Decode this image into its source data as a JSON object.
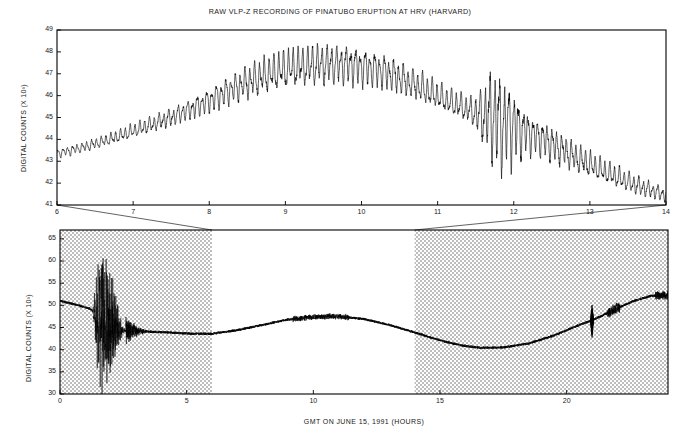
{
  "figure": {
    "title": "RAW VLP-Z RECORDING OF PINATUBO ERUPTION AT HRV (HARVARD)",
    "background_color": "#ffffff",
    "trace_color": "#000000",
    "shade_color": "#d2d2d2"
  },
  "chart_data": [
    {
      "id": "top-panel",
      "type": "line",
      "title": "RAW VLP-Z RECORDING OF PINATUBO ERUPTION AT HRV (HARVARD)",
      "xlabel": "",
      "ylabel": "DIGITAL COUNTS (X 10³)",
      "xlim": [
        6,
        14
      ],
      "ylim": [
        41,
        49
      ],
      "xticks": [
        6,
        7,
        8,
        9,
        10,
        11,
        12,
        13,
        14
      ],
      "yticks": [
        41,
        42,
        43,
        44,
        45,
        46,
        47,
        48,
        49
      ],
      "xticklabels": [
        "6",
        "7",
        "8",
        "9",
        "10",
        "11",
        "12",
        "13",
        "14"
      ],
      "yticklabels": [
        "41",
        "42",
        "43",
        "44",
        "45",
        "46",
        "47",
        "48",
        "49"
      ],
      "grid": false,
      "legend": "none",
      "description": "Expanded view of hours 6-14, long-period oscillation riding on a broad arch",
      "envelope": {
        "x": [
          6.0,
          6.3,
          6.7,
          7.1,
          7.5,
          7.9,
          8.3,
          8.7,
          9.1,
          9.5,
          9.9,
          10.3,
          10.7,
          11.1,
          11.5,
          11.7,
          12.0,
          12.4,
          12.8,
          13.2,
          13.6,
          14.0
        ],
        "baseline": [
          43.35,
          43.6,
          44.0,
          44.5,
          45.0,
          45.6,
          46.3,
          46.9,
          47.3,
          47.45,
          47.4,
          47.1,
          46.5,
          45.8,
          45.2,
          45.0,
          44.6,
          44.0,
          43.2,
          42.5,
          41.9,
          41.45
        ],
        "amplitude": [
          0.18,
          0.2,
          0.24,
          0.3,
          0.36,
          0.45,
          0.58,
          0.72,
          0.8,
          0.82,
          0.78,
          0.7,
          0.62,
          0.55,
          0.52,
          0.95,
          0.9,
          0.72,
          0.6,
          0.48,
          0.38,
          0.3
        ]
      },
      "oscillation_period_hours": 0.063,
      "burst": {
        "center": 11.8,
        "halfwidth": 0.45,
        "gain": 2.1
      }
    },
    {
      "id": "bottom-panel",
      "type": "line",
      "title": "",
      "xlabel": "GMT ON JUNE 15, 1991 (HOURS)",
      "ylabel": "DIGITAL COUNTS (X 10³)",
      "xlim": [
        0,
        24
      ],
      "ylim": [
        30,
        67
      ],
      "xticks": [
        0,
        5,
        10,
        15,
        20
      ],
      "yticks": [
        30,
        35,
        40,
        45,
        50,
        55,
        60,
        65
      ],
      "xticklabels": [
        "0",
        "5",
        "10",
        "15",
        "20"
      ],
      "yticklabels": [
        "30",
        "35",
        "40",
        "45",
        "50",
        "55",
        "60",
        "65"
      ],
      "grid": false,
      "legend": "none",
      "description": "Full 24-hour record; shaded outside hours 6-14; large eruption wavetrain near hours 1.5-2.5; narrow spike near hour 21",
      "highlight_window": [
        6,
        14
      ],
      "shaded_windows": [
        [
          0,
          6
        ],
        [
          14,
          24
        ]
      ],
      "envelope": {
        "x": [
          0.0,
          0.6,
          1.2,
          1.6,
          2.0,
          2.4,
          2.8,
          3.2,
          3.8,
          4.5,
          5.2,
          6.0,
          7.0,
          8.0,
          9.0,
          10.0,
          10.6,
          11.2,
          12.0,
          13.0,
          14.0,
          15.0,
          15.8,
          16.6,
          17.5,
          18.5,
          19.5,
          20.5,
          21.0,
          21.8,
          22.6,
          23.3,
          24.0
        ],
        "baseline": [
          51.0,
          50.2,
          49.2,
          47.0,
          44.7,
          44.2,
          44.3,
          44.1,
          44.0,
          43.8,
          43.6,
          43.6,
          44.4,
          45.6,
          46.8,
          47.4,
          47.5,
          47.4,
          46.9,
          45.6,
          43.9,
          42.1,
          41.0,
          40.4,
          40.5,
          41.4,
          43.2,
          45.6,
          46.6,
          48.8,
          50.9,
          52.1,
          52.4
        ]
      },
      "events": [
        {
          "name": "eruption-wavetrain",
          "start": 1.3,
          "end": 2.6,
          "peak_high": 66.0,
          "peak_low": 30.5
        },
        {
          "name": "coda",
          "start": 2.6,
          "end": 3.6,
          "peak_high": 46.5,
          "peak_low": 41.5
        },
        {
          "name": "spike",
          "time": 21.0,
          "high": 50.0,
          "low": 42.6
        }
      ]
    }
  ],
  "connectors": {
    "left": {
      "from_hour": 6,
      "to_hour": 6
    },
    "right": {
      "from_hour": 14,
      "to_hour": 14
    },
    "note": "lines linking top panel edges to the unshaded 6-14 window of the bottom panel"
  }
}
